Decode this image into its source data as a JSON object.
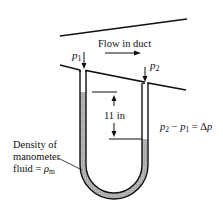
{
  "diagram": {
    "flow_label": "Flow in duct",
    "p1_label": "p",
    "p1_sub": "1",
    "p2_label": "p",
    "p2_sub": "2",
    "height_label": "11 in",
    "equation": {
      "a": "p",
      "a_sub": "2",
      "minus": " − ",
      "b": "p",
      "b_sub": "1",
      "eq": " = Δ",
      "c": "p"
    },
    "density_label": {
      "line1": "Density of",
      "line2": "manometer",
      "line3_prefix": "fluid = ",
      "rho": "ρ",
      "rho_sub": "m"
    },
    "colors": {
      "stroke": "#111111",
      "fluid_fill": "#b8b8b8",
      "background": "#ffffff"
    }
  }
}
